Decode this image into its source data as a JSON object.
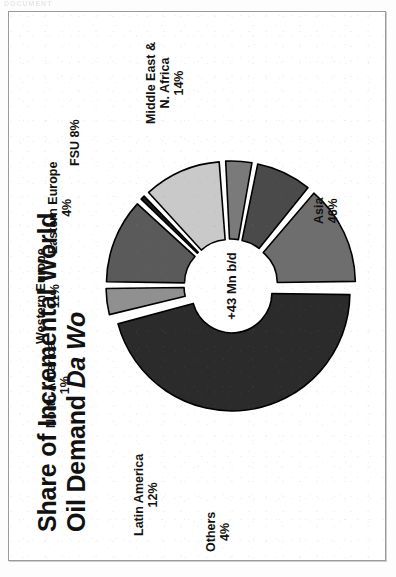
{
  "scan": {
    "header_artifact": "DOCUMENT",
    "frame_color": "#9a9a9a"
  },
  "slide": {
    "title_line1": "Share of Incremental World",
    "title_line2_normal": "Oil Demand ",
    "title_line2_italic": "Da Wo"
  },
  "chart_data": {
    "type": "pie",
    "variant": "exploded-donut",
    "title": "Share of Incremental World Oil Demand Da Wo",
    "center_label": "+43 Mn b/d",
    "total_label": "+43 Mn b/d",
    "units": "percent of incremental world oil demand",
    "categories": [
      "Asia",
      "Middle East & N. Africa",
      "Latin America",
      "Western Europe",
      "FSU",
      "Eastern Europe",
      "Others",
      "North America"
    ],
    "values": [
      46,
      14,
      12,
      11,
      8,
      4,
      4,
      1
    ],
    "legend_position": "callout-labels",
    "grid": false,
    "slices": [
      {
        "name": "Asia",
        "label_line1": "Asia",
        "label_line2": "46%",
        "value": 46,
        "color": "#2b2b2b",
        "start_deg": 90,
        "end_deg": 255.6
      },
      {
        "name": "Middle East & N. Africa",
        "label_line1": "Middle East &",
        "label_line2": "N. Africa",
        "label_line3": "14%",
        "value": 14,
        "color": "#6e6e6e",
        "start_deg": 39.6,
        "end_deg": 90
      },
      {
        "name": "FSU",
        "label_line1": "FSU 8%",
        "label_line2": "",
        "value": 8,
        "color": "#4a4a4a",
        "start_deg": 10.8,
        "end_deg": 39.6
      },
      {
        "name": "Eastern Europe",
        "label_line1": "Eastern Europe",
        "label_line2": "4%",
        "value": 4,
        "color": "#7a7a7a",
        "start_deg": -3.6,
        "end_deg": 10.8
      },
      {
        "name": "Western Europe",
        "label_line1": "Western Europe",
        "label_line2": "11%",
        "value": 11,
        "color": "#c9c9c9",
        "start_deg": -43.2,
        "end_deg": -3.6
      },
      {
        "name": "North America",
        "label_line1": "North America",
        "label_line2": "1%",
        "value": 1,
        "color": "#1c1c1c",
        "start_deg": -46.8,
        "end_deg": -43.2
      },
      {
        "name": "Latin America",
        "label_line1": "Latin America",
        "label_line2": "12%",
        "value": 12,
        "color": "#5a5a5a",
        "start_deg": -90,
        "end_deg": -46.8
      },
      {
        "name": "Others",
        "label_line1": "Others",
        "label_line2": "4%",
        "value": 4,
        "color": "#909090",
        "start_deg": -104.4,
        "end_deg": -90
      }
    ],
    "colors": {
      "asia": "#2b2b2b",
      "middle_east_n_africa": "#6e6e6e",
      "fsu": "#4a4a4a",
      "eastern_europe": "#7a7a7a",
      "western_europe": "#c9c9c9",
      "north_america": "#1c1c1c",
      "latin_america": "#5a5a5a",
      "others": "#909090",
      "outline": "#000000",
      "background": "#ffffff"
    }
  }
}
